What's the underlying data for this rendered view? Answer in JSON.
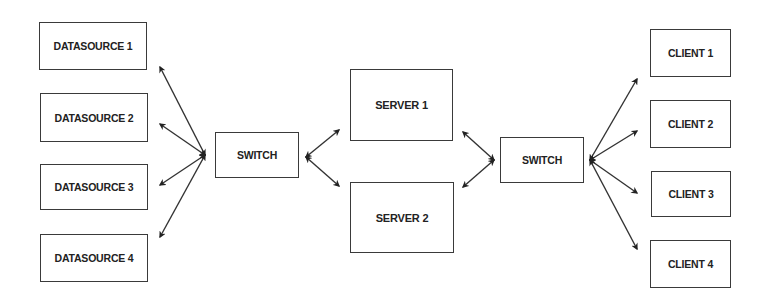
{
  "diagram": {
    "type": "network-topology",
    "colors": {
      "line": "#333333",
      "border": "#3a3a3a",
      "text": "#222222",
      "background": "#ffffff"
    },
    "nodes": {
      "datasource_1": {
        "label": "DATASOURCE 1",
        "box": [
          39,
          22,
          108,
          48
        ]
      },
      "datasource_2": {
        "label": "DATASOURCE 2",
        "box": [
          40,
          93,
          108,
          49
        ]
      },
      "datasource_3": {
        "label": "DATASOURCE 3",
        "box": [
          40,
          164,
          108,
          46
        ]
      },
      "datasource_4": {
        "label": "DATASOURCE 4",
        "box": [
          40,
          234,
          108,
          48
        ]
      },
      "switch_1": {
        "label": "SWITCH",
        "box": [
          215,
          132,
          84,
          46
        ]
      },
      "server_1": {
        "label": "SERVER 1",
        "box": [
          350,
          69,
          103,
          72
        ]
      },
      "server_2": {
        "label": "SERVER 2",
        "box": [
          350,
          182,
          104,
          71
        ]
      },
      "switch_2": {
        "label": "SWITCH",
        "box": [
          500,
          137,
          84,
          46
        ]
      },
      "client_1": {
        "label": "CLIENT 1",
        "box": [
          650,
          29,
          81,
          48
        ]
      },
      "client_2": {
        "label": "CLIENT 2",
        "box": [
          650,
          100,
          81,
          48
        ]
      },
      "client_3": {
        "label": "CLIENT 3",
        "box": [
          651,
          171,
          80,
          46
        ]
      },
      "client_4": {
        "label": "CLIENT 4",
        "box": [
          650,
          240,
          81,
          48
        ]
      }
    },
    "edges": [
      {
        "from": "switch_1",
        "to": "datasource_1",
        "bidirectional": true
      },
      {
        "from": "switch_1",
        "to": "datasource_2",
        "bidirectional": true
      },
      {
        "from": "switch_1",
        "to": "datasource_3",
        "bidirectional": true
      },
      {
        "from": "switch_1",
        "to": "datasource_4",
        "bidirectional": true
      },
      {
        "from": "switch_1",
        "to": "server_1",
        "bidirectional": true
      },
      {
        "from": "switch_1",
        "to": "server_2",
        "bidirectional": true
      },
      {
        "from": "server_1",
        "to": "switch_2",
        "bidirectional": true
      },
      {
        "from": "server_2",
        "to": "switch_2",
        "bidirectional": true
      },
      {
        "from": "switch_2",
        "to": "client_1",
        "bidirectional": true
      },
      {
        "from": "switch_2",
        "to": "client_2",
        "bidirectional": true
      },
      {
        "from": "switch_2",
        "to": "client_3",
        "bidirectional": true
      },
      {
        "from": "switch_2",
        "to": "client_4",
        "bidirectional": true
      }
    ]
  }
}
